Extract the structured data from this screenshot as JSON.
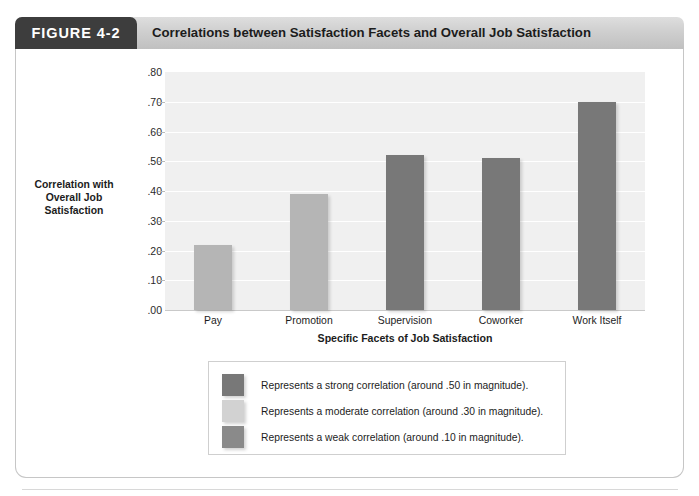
{
  "figure": {
    "tab_label": "FIGURE 4-2",
    "title": "Correlations between Satisfaction Facets and Overall Job Satisfaction"
  },
  "chart_data": {
    "type": "bar",
    "title": "Correlations between Satisfaction Facets and Overall Job Satisfaction",
    "categories": [
      "Pay",
      "Promotion",
      "Supervision",
      "Coworker",
      "Work Itself"
    ],
    "values": [
      0.22,
      0.39,
      0.52,
      0.51,
      0.7
    ],
    "value_labels": [
      ".22",
      ".39",
      ".52",
      ".51",
      ".70"
    ],
    "bar_colors": [
      "#b5b5b5",
      "#b5b5b5",
      "#787878",
      "#787878",
      "#787878"
    ],
    "xlabel": "Specific Facets of Job Satisfaction",
    "ylabel": "Correlation with Overall Job Satisfaction",
    "ylabel_lines": [
      "Correlation with",
      "Overall Job",
      "Satisfaction"
    ],
    "ylim": [
      0.0,
      0.8
    ],
    "ytick_labels": [
      ".80",
      ".70",
      ".60",
      ".50",
      ".40",
      ".30",
      ".20",
      ".10",
      ".00"
    ],
    "ytick_values": [
      0.8,
      0.7,
      0.6,
      0.5,
      0.4,
      0.3,
      0.2,
      0.1,
      0.0
    ],
    "grid": true,
    "legend_position": "below-plot",
    "legend": [
      {
        "label": "Represents a strong correlation (around .50 in magnitude).",
        "color": "#787878"
      },
      {
        "label": "Represents a moderate correlation (around .30 in magnitude).",
        "color": "#d2d2d2"
      },
      {
        "label": "Represents a weak correlation (around .10 in magnitude).",
        "color": "#8a8a8a"
      }
    ]
  }
}
